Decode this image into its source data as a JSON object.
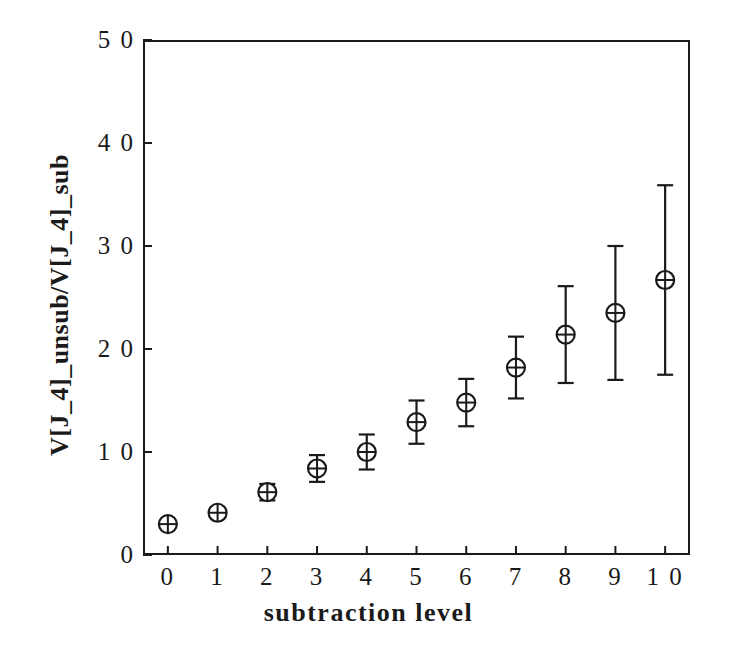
{
  "chart_data": {
    "type": "scatter",
    "title": "",
    "xlabel": "subtraction level",
    "ylabel": "V[J_4]_unsub/V[J_4]_sub",
    "x": [
      0,
      1,
      2,
      3,
      4,
      5,
      6,
      7,
      8,
      9,
      10
    ],
    "values": [
      0.3,
      0.41,
      0.61,
      0.84,
      1.0,
      1.29,
      1.48,
      1.82,
      2.14,
      2.35,
      2.67
    ],
    "yerr": [
      0.04,
      0.05,
      0.08,
      0.13,
      0.17,
      0.21,
      0.23,
      0.3,
      0.47,
      0.65,
      0.92
    ],
    "xlim": [
      -0.5,
      10.5
    ],
    "ylim": [
      0,
      5.0
    ],
    "xticks": [
      0,
      1,
      2,
      3,
      4,
      5,
      6,
      7,
      8,
      9,
      10
    ],
    "xtick_labels": [
      "0",
      "1",
      "2",
      "3",
      "4",
      "5",
      "6",
      "7",
      "8",
      "9",
      "1 0"
    ],
    "yticks": [
      0,
      1.0,
      2.0,
      3.0,
      4.0,
      5.0
    ],
    "ytick_labels": [
      "0",
      "1 0",
      "2 0",
      "3 0",
      "4 0",
      "5 0"
    ],
    "grid": false,
    "legend": false,
    "marker": "circle-with-cross",
    "marker_radius": 9,
    "errorbar_cap_width": 16,
    "series_color": "#1a1a1a",
    "axis_color": "#1a1a1a",
    "background_color": "#ffffff"
  },
  "axes": {
    "x_title": "subtraction level",
    "y_title": "V[J_4]_unsub/V[J_4]_sub"
  },
  "geometry": {
    "plot_left": 143,
    "plot_top": 40,
    "plot_right": 690,
    "plot_bottom": 555,
    "tick_length": 9
  }
}
